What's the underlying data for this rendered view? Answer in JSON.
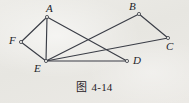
{
  "figure": {
    "caption_cjk": "图",
    "caption_number": "4-14",
    "caption_full": "图 4-14",
    "width": 189,
    "height": 103,
    "background_color": "#e9e8e4",
    "stroke_color": "#3a3d46",
    "label_color": "#23242a",
    "stroke_width": 1.15,
    "vertex_marker": "small-open-circle",
    "vertex_marker_radius": 1.6
  },
  "diagram": {
    "type": "plane-geometry-line-figure",
    "vertices": [
      {
        "id": "A",
        "label": "A",
        "x": 47,
        "y": 17,
        "label_x": 46,
        "label_y": 3,
        "marker": true
      },
      {
        "id": "B",
        "label": "B",
        "x": 139,
        "y": 14,
        "label_x": 129,
        "label_y": 1,
        "marker": true
      },
      {
        "id": "C",
        "label": "C",
        "x": 168,
        "y": 38,
        "label_x": 166,
        "label_y": 41,
        "marker": true
      },
      {
        "id": "D",
        "label": "D",
        "x": 127,
        "y": 61,
        "label_x": 133,
        "label_y": 55,
        "marker": true
      },
      {
        "id": "E",
        "label": "E",
        "x": 46,
        "y": 61,
        "label_x": 34,
        "label_y": 63,
        "marker": true
      },
      {
        "id": "F",
        "label": "F",
        "x": 21,
        "y": 42,
        "label_x": 9,
        "label_y": 35,
        "marker": true
      }
    ],
    "edges": [
      {
        "id": "AF",
        "from": "A",
        "to": "F"
      },
      {
        "id": "FE",
        "from": "F",
        "to": "E"
      },
      {
        "id": "AE",
        "from": "A",
        "to": "E"
      },
      {
        "id": "AD",
        "from": "A",
        "to": "D"
      },
      {
        "id": "ED",
        "from": "E",
        "to": "D"
      },
      {
        "id": "EC",
        "from": "E",
        "to": "C"
      },
      {
        "id": "EB",
        "from": "E",
        "to": "B"
      },
      {
        "id": "BC",
        "from": "B",
        "to": "C"
      }
    ]
  }
}
